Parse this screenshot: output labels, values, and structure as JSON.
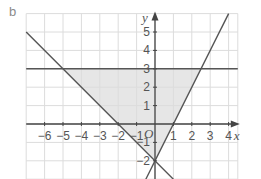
{
  "part_label": "b",
  "colors": {
    "grid": "#dcdcdc",
    "axis": "#444444",
    "line": "#555555",
    "shade": "#e6e6e6",
    "text": "#555555"
  },
  "axes": {
    "x_name": "x",
    "y_name": "y",
    "origin_label": "O",
    "x_ticks": [
      "−6",
      "−5",
      "−4",
      "−3",
      "−2",
      "−1",
      "1",
      "2",
      "3",
      "4"
    ],
    "y_ticks": [
      "5",
      "4",
      "3",
      "2",
      "1",
      "−1",
      "−2"
    ]
  },
  "chart_data": {
    "type": "line",
    "title": "",
    "xlabel": "x",
    "ylabel": "y",
    "xlim": [
      -7,
      4.5
    ],
    "ylim": [
      -3,
      6
    ],
    "grid": true,
    "series": [
      {
        "name": "y = 3",
        "points": [
          [
            -7,
            3
          ],
          [
            4.5,
            3
          ]
        ]
      },
      {
        "name": "y = -x - 2",
        "points": [
          [
            -7,
            5
          ],
          [
            1,
            -3
          ]
        ]
      },
      {
        "name": "y = 2x - 2",
        "points": [
          [
            -0.5,
            -3
          ],
          [
            4,
            6
          ]
        ]
      }
    ],
    "shaded_region": {
      "description": "Triangle bounded by y = 3, y = -x - 2 and y = 2x - 2",
      "vertices": [
        [
          -5,
          3
        ],
        [
          2.5,
          3
        ],
        [
          0,
          -2
        ]
      ]
    },
    "x_tick_labels": [
      -6,
      -5,
      -4,
      -3,
      -2,
      -1,
      1,
      2,
      3,
      4
    ],
    "y_tick_labels": [
      5,
      4,
      3,
      2,
      1,
      -1,
      -2
    ]
  }
}
